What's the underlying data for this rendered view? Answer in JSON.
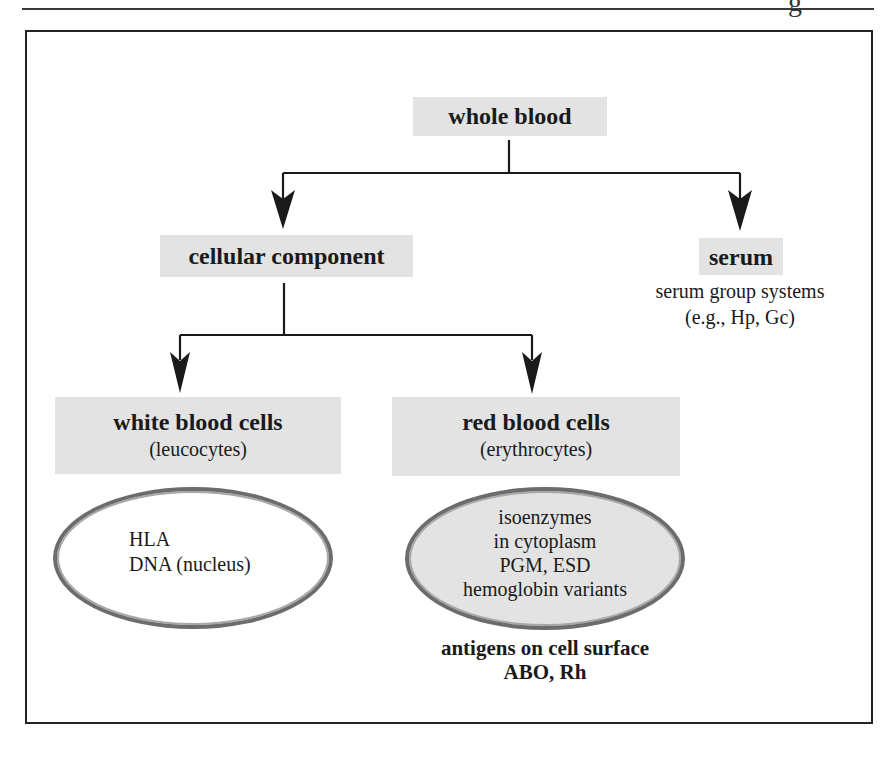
{
  "page": {
    "header_glyph": "g"
  },
  "diagram": {
    "root": {
      "label": "whole blood"
    },
    "cellular": {
      "label": "cellular component"
    },
    "serum": {
      "label": "serum",
      "description_line1": "serum group systems",
      "description_line2": "(e.g., Hp, Gc)"
    },
    "white_cells": {
      "label": "white blood cells",
      "sublabel": "(leucocytes)",
      "contents": [
        "HLA",
        "DNA (nucleus)"
      ]
    },
    "red_cells": {
      "label": "red blood cells",
      "sublabel": "(erythrocytes)",
      "contents": [
        "isoenzymes",
        "in cytoplasm",
        "PGM, ESD",
        "hemoglobin variants"
      ],
      "surface_line1": "antigens on cell surface",
      "surface_line2": "ABO, Rh"
    },
    "colors": {
      "box_fill": "#e3e3e3",
      "ellipse_red_fill": "#e3e3e3",
      "ellipse_white_fill": "#ffffff",
      "line": "#1a1a1a"
    }
  }
}
